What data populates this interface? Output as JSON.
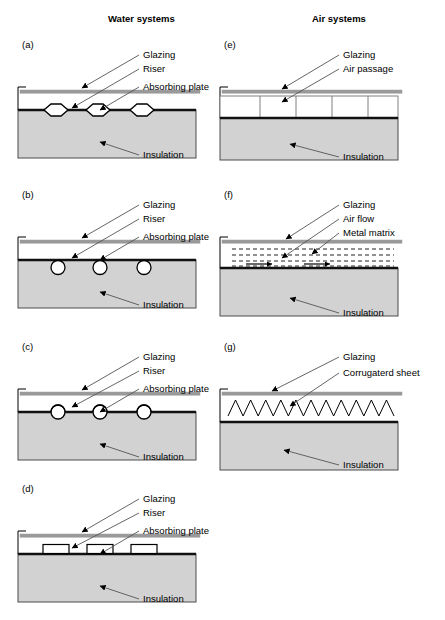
{
  "figure": {
    "width": 445,
    "height": 620,
    "background": "#ffffff",
    "columns": [
      {
        "id": "water",
        "title": "Water systems",
        "title_x": 108,
        "title_y": 22
      },
      {
        "id": "air",
        "title": "Air systems",
        "title_x": 312,
        "title_y": 22
      }
    ],
    "colors": {
      "insulation_fill": "#d2d2d2",
      "insulation_stroke": "#4d4d4d",
      "absorbing_plate": "#111111",
      "glazing": "#9a9a9a",
      "line": "#000000",
      "leader": "#555555",
      "text": "#000000",
      "tube_fill": "#ffffff"
    }
  },
  "panels": [
    {
      "id": "a",
      "label": "(a)",
      "label_x": 22,
      "label_y": 48,
      "column": "water",
      "origin_x": 14,
      "origin_y": 38,
      "body_x": 4,
      "body_w": 178,
      "glazing_y": 52,
      "plate_y": 72,
      "insulation_y": 72,
      "insulation_h": 48,
      "riser_shape": "hexagon",
      "riser_count": 3,
      "riser_positions": [
        38,
        80,
        124
      ],
      "riser_w": 24,
      "riser_h": 12,
      "riser_offset": "straddle",
      "callouts": [
        {
          "text": "Glazing",
          "tx": 129,
          "ty": 20,
          "ax": 68,
          "ay": 50
        },
        {
          "text": "Riser",
          "tx": 129,
          "ty": 34,
          "ax": 58,
          "ay": 70
        },
        {
          "text": "Absorbing plate",
          "tx": 129,
          "ty": 52,
          "ax": 86,
          "ay": 72
        },
        {
          "text": "Insulation",
          "tx": 129,
          "ty": 120,
          "ax": 86,
          "ay": 104
        }
      ]
    },
    {
      "id": "b",
      "label": "(b)",
      "label_x": 22,
      "label_y": 198,
      "column": "water",
      "origin_x": 14,
      "origin_y": 188,
      "body_x": 4,
      "body_w": 178,
      "glazing_y": 52,
      "plate_y": 72,
      "insulation_y": 72,
      "insulation_h": 48,
      "riser_shape": "circle",
      "riser_count": 3,
      "riser_positions": [
        40,
        82,
        126
      ],
      "riser_w": 14,
      "riser_h": 14,
      "riser_offset": "below",
      "callouts": [
        {
          "text": "Glazing",
          "tx": 129,
          "ty": 20,
          "ax": 68,
          "ay": 50
        },
        {
          "text": "Riser",
          "tx": 129,
          "ty": 34,
          "ax": 58,
          "ay": 70
        },
        {
          "text": "Absorbing plate",
          "tx": 129,
          "ty": 52,
          "ax": 86,
          "ay": 72
        },
        {
          "text": "Insulation",
          "tx": 129,
          "ty": 120,
          "ax": 86,
          "ay": 104
        }
      ]
    },
    {
      "id": "c",
      "label": "(c)",
      "label_x": 22,
      "label_y": 350,
      "column": "water",
      "origin_x": 14,
      "origin_y": 340,
      "body_x": 4,
      "body_w": 178,
      "glazing_y": 52,
      "plate_y": 72,
      "insulation_y": 72,
      "insulation_h": 48,
      "riser_shape": "circle",
      "riser_count": 3,
      "riser_positions": [
        40,
        82,
        126
      ],
      "riser_w": 14,
      "riser_h": 14,
      "riser_offset": "straddle",
      "callouts": [
        {
          "text": "Glazing",
          "tx": 129,
          "ty": 20,
          "ax": 68,
          "ay": 50
        },
        {
          "text": "Riser",
          "tx": 129,
          "ty": 34,
          "ax": 58,
          "ay": 67
        },
        {
          "text": "Absorbing plate",
          "tx": 129,
          "ty": 52,
          "ax": 86,
          "ay": 72
        },
        {
          "text": "Insulation",
          "tx": 129,
          "ty": 120,
          "ax": 86,
          "ay": 104
        }
      ]
    },
    {
      "id": "d",
      "label": "(d)",
      "label_x": 22,
      "label_y": 492,
      "column": "water",
      "origin_x": 14,
      "origin_y": 482,
      "body_x": 4,
      "body_w": 178,
      "glazing_y": 52,
      "plate_y": 72,
      "insulation_y": 72,
      "insulation_h": 48,
      "riser_shape": "rect",
      "riser_count": 3,
      "riser_positions": [
        38,
        82,
        126
      ],
      "riser_w": 26,
      "riser_h": 9,
      "riser_offset": "above",
      "callouts": [
        {
          "text": "Glazing",
          "tx": 129,
          "ty": 20,
          "ax": 68,
          "ay": 50
        },
        {
          "text": "Riser",
          "tx": 129,
          "ty": 34,
          "ax": 58,
          "ay": 66
        },
        {
          "text": "Absorbing plate",
          "tx": 129,
          "ty": 52,
          "ax": 86,
          "ay": 72
        },
        {
          "text": "Insulation",
          "tx": 129,
          "ty": 120,
          "ax": 86,
          "ay": 104
        }
      ]
    },
    {
      "id": "e",
      "label": "(e)",
      "label_x": 224,
      "label_y": 48,
      "column": "air",
      "origin_x": 216,
      "origin_y": 38,
      "body_x": 4,
      "body_w": 178,
      "glazing_y": 52,
      "plate_y": 80,
      "insulation_y": 80,
      "insulation_h": 42,
      "riser_shape": "air-channels",
      "riser_count": 4,
      "channel_top": 58,
      "channel_bottom": 80,
      "channel_dividers": [
        40,
        76,
        112,
        148
      ],
      "callouts": [
        {
          "text": "Glazing",
          "tx": 127,
          "ty": 20,
          "ax": 66,
          "ay": 51
        },
        {
          "text": "Air passage",
          "tx": 127,
          "ty": 34,
          "ax": 66,
          "ay": 64
        },
        {
          "text": "Insulation",
          "tx": 127,
          "ty": 122,
          "ax": 74,
          "ay": 106
        }
      ]
    },
    {
      "id": "f",
      "label": "(f)",
      "label_x": 224,
      "label_y": 198,
      "column": "air",
      "origin_x": 216,
      "origin_y": 188,
      "body_x": 4,
      "body_w": 178,
      "glazing_y": 52,
      "plate_y": 80,
      "insulation_y": 80,
      "insulation_h": 48,
      "riser_shape": "metal-matrix",
      "matrix_rows": [
        61,
        67,
        73,
        78
      ],
      "matrix_x": 12,
      "matrix_w": 162,
      "flow_arrows": [
        {
          "x": 26,
          "y": 76,
          "len": 26
        },
        {
          "x": 84,
          "y": 76,
          "len": 26
        }
      ],
      "callouts": [
        {
          "text": "Glazing",
          "tx": 127,
          "ty": 20,
          "ax": 70,
          "ay": 51
        },
        {
          "text": "Air flow",
          "tx": 127,
          "ty": 34,
          "ax": 66,
          "ay": 70
        },
        {
          "text": "Metal matrix",
          "tx": 127,
          "ty": 48,
          "ax": 96,
          "ay": 66
        },
        {
          "text": "Insulation",
          "tx": 127,
          "ty": 128,
          "ax": 74,
          "ay": 110
        }
      ]
    },
    {
      "id": "g",
      "label": "(g)",
      "label_x": 224,
      "label_y": 350,
      "column": "air",
      "origin_x": 216,
      "origin_y": 340,
      "body_x": 4,
      "body_w": 178,
      "glazing_y": 52,
      "plate_y": 82,
      "insulation_y": 82,
      "insulation_h": 48,
      "riser_shape": "corrugated",
      "corrugation_peaks": 11,
      "corrugation_top": 60,
      "corrugation_bottom": 76,
      "corrugation_x": 8,
      "corrugation_w": 166,
      "callouts": [
        {
          "text": "Glazing",
          "tx": 127,
          "ty": 20,
          "ax": 56,
          "ay": 51
        },
        {
          "text": "Corrugaterd sheet",
          "tx": 127,
          "ty": 36,
          "ax": 74,
          "ay": 66
        },
        {
          "text": "Insulation",
          "tx": 127,
          "ty": 128,
          "ax": 68,
          "ay": 110
        }
      ]
    }
  ]
}
